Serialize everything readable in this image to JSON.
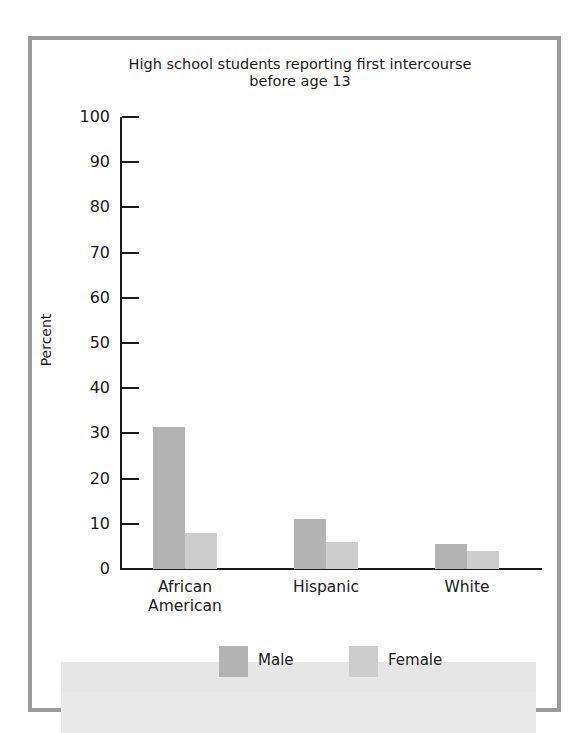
{
  "figure": {
    "title_line1": "High school students reporting first intercourse",
    "title_line2": "before age 13",
    "ylabel": "Percent",
    "yticks": [
      "0",
      "10",
      "20",
      "30",
      "40",
      "50",
      "60",
      "70",
      "80",
      "90",
      "100"
    ],
    "categories": [
      {
        "line1": "African",
        "line2": "American"
      },
      {
        "line1": "Hispanic",
        "line2": ""
      },
      {
        "line1": "White",
        "line2": ""
      }
    ],
    "legend": {
      "male": "Male",
      "female": "Female"
    },
    "colors": {
      "male": "#b3b3b3",
      "female": "#cdcdcd",
      "frame": "#9c9c9c"
    }
  },
  "chart_data": {
    "type": "bar",
    "title": "High school students reporting first intercourse before age 13",
    "xlabel": "",
    "ylabel": "Percent",
    "ylim": [
      0,
      100
    ],
    "yticks": [
      0,
      10,
      20,
      30,
      40,
      50,
      60,
      70,
      80,
      90,
      100
    ],
    "categories": [
      "African American",
      "Hispanic",
      "White"
    ],
    "series": [
      {
        "name": "Male",
        "values": [
          31.5,
          11,
          5.5
        ],
        "color": "#b3b3b3"
      },
      {
        "name": "Female",
        "values": [
          8,
          6,
          4
        ],
        "color": "#cdcdcd"
      }
    ],
    "grid": false,
    "legend_position": "bottom"
  }
}
